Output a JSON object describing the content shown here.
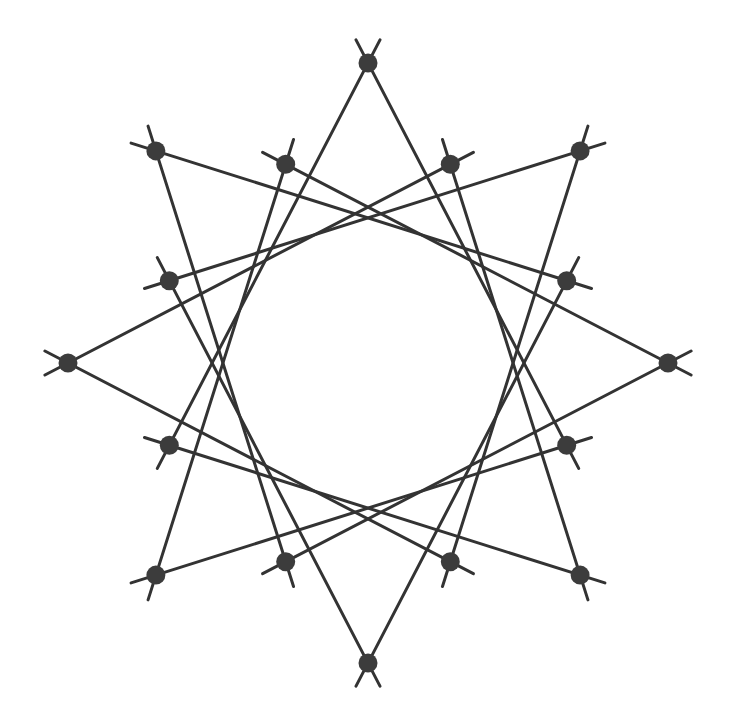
{
  "figure": {
    "type": "star-polygon-diagram",
    "background_color": "#ffffff",
    "canvas": {
      "width": 733,
      "height": 727
    }
  },
  "chart_data": {
    "type": "scatter",
    "xlabel": "",
    "ylabel": "",
    "grid": false,
    "legend": null,
    "geometry": {
      "center": {
        "x": 368,
        "y": 363
      },
      "point_count": 16,
      "outer_ring_radius": 300,
      "inner_ring_radius": 215,
      "start_angle_deg": -90,
      "angle_step_deg": 22.5,
      "outer_indices": [
        0,
        2,
        4,
        6,
        8,
        10,
        12,
        14
      ],
      "inner_indices": [
        1,
        3,
        5,
        7,
        9,
        11,
        13,
        15
      ],
      "chord_step": 5,
      "chord_overshoot_px": 26,
      "edge_color": "#333333",
      "edge_width": 3.0,
      "node_color": "#3c3c3c",
      "node_radius": 9.5
    },
    "points": [
      {
        "index": 0,
        "ring": "outer",
        "angle_deg": -90.0,
        "x": 368.0,
        "y": 63.0
      },
      {
        "index": 1,
        "ring": "inner",
        "angle_deg": -67.5,
        "x": 450.3,
        "y": 164.3
      },
      {
        "index": 2,
        "ring": "outer",
        "angle_deg": -45.0,
        "x": 580.1,
        "y": 150.9
      },
      {
        "index": 3,
        "ring": "inner",
        "angle_deg": -22.5,
        "x": 566.7,
        "y": 280.7
      },
      {
        "index": 4,
        "ring": "outer",
        "angle_deg": 0.0,
        "x": 668.0,
        "y": 363.0
      },
      {
        "index": 5,
        "ring": "inner",
        "angle_deg": 22.5,
        "x": 566.7,
        "y": 445.3
      },
      {
        "index": 6,
        "ring": "outer",
        "angle_deg": 45.0,
        "x": 580.1,
        "y": 575.1
      },
      {
        "index": 7,
        "ring": "inner",
        "angle_deg": 67.5,
        "x": 450.3,
        "y": 561.7
      },
      {
        "index": 8,
        "ring": "outer",
        "angle_deg": 90.0,
        "x": 368.0,
        "y": 663.0
      },
      {
        "index": 9,
        "ring": "inner",
        "angle_deg": 112.5,
        "x": 285.7,
        "y": 561.7
      },
      {
        "index": 10,
        "ring": "outer",
        "angle_deg": 135.0,
        "x": 155.9,
        "y": 575.1
      },
      {
        "index": 11,
        "ring": "inner",
        "angle_deg": 157.5,
        "x": 169.3,
        "y": 445.3
      },
      {
        "index": 12,
        "ring": "outer",
        "angle_deg": 180.0,
        "x": 68.0,
        "y": 363.0
      },
      {
        "index": 13,
        "ring": "inner",
        "angle_deg": 202.5,
        "x": 169.3,
        "y": 280.7
      },
      {
        "index": 14,
        "ring": "outer",
        "angle_deg": 225.0,
        "x": 155.9,
        "y": 150.9
      },
      {
        "index": 15,
        "ring": "inner",
        "angle_deg": 247.5,
        "x": 285.7,
        "y": 164.3
      }
    ],
    "edges": [
      {
        "from": 0,
        "to": 5
      },
      {
        "from": 1,
        "to": 6
      },
      {
        "from": 2,
        "to": 7
      },
      {
        "from": 3,
        "to": 8
      },
      {
        "from": 4,
        "to": 9
      },
      {
        "from": 5,
        "to": 10
      },
      {
        "from": 6,
        "to": 11
      },
      {
        "from": 7,
        "to": 12
      },
      {
        "from": 8,
        "to": 13
      },
      {
        "from": 9,
        "to": 14
      },
      {
        "from": 10,
        "to": 15
      },
      {
        "from": 11,
        "to": 0
      },
      {
        "from": 12,
        "to": 1
      },
      {
        "from": 13,
        "to": 2
      },
      {
        "from": 14,
        "to": 3
      },
      {
        "from": 15,
        "to": 4
      }
    ]
  }
}
